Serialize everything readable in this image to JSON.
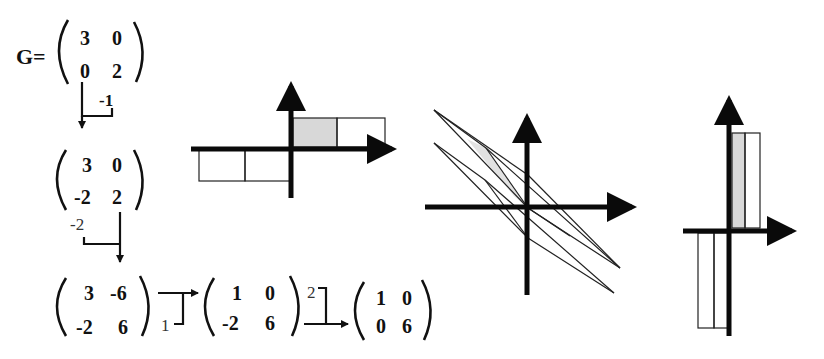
{
  "diagram": {
    "title_label": "G=",
    "matrices": [
      {
        "id": "G",
        "rows": [
          [
            "3",
            "0"
          ],
          [
            "0",
            "2"
          ]
        ]
      },
      {
        "id": "step1",
        "rows": [
          [
            "3",
            "0"
          ],
          [
            "-2",
            "2"
          ]
        ]
      },
      {
        "id": "step2",
        "rows": [
          [
            "3",
            "-6"
          ],
          [
            "-2",
            "6"
          ]
        ]
      },
      {
        "id": "step3",
        "rows": [
          [
            "1",
            "0"
          ],
          [
            "-2",
            "6"
          ]
        ]
      },
      {
        "id": "step4",
        "rows": [
          [
            "1",
            "0"
          ],
          [
            "0",
            "6"
          ]
        ]
      }
    ],
    "operations": [
      {
        "from": "G",
        "to": "step1",
        "multiplier": "-1"
      },
      {
        "from": "step1",
        "to": "step2",
        "multiplier": "-2"
      },
      {
        "from": "step2",
        "to": "step3",
        "multiplier": "1"
      },
      {
        "from": "step3",
        "to": "step4",
        "multiplier": "2"
      }
    ],
    "panels": [
      {
        "id": "panel-1",
        "description": "Axis-aligned cells: two unit cells above x-axis on right (first shaded), two below on left"
      },
      {
        "id": "panel-2",
        "description": "Sheared parallelogram cells crossing origin diagonally"
      },
      {
        "id": "panel-3",
        "description": "Tall narrow cells: two above x-axis right of y-axis (first shaded), two below left"
      }
    ],
    "colors": {
      "ink": "#111111",
      "shade": "#d8d8d8",
      "background": "#ffffff"
    }
  }
}
